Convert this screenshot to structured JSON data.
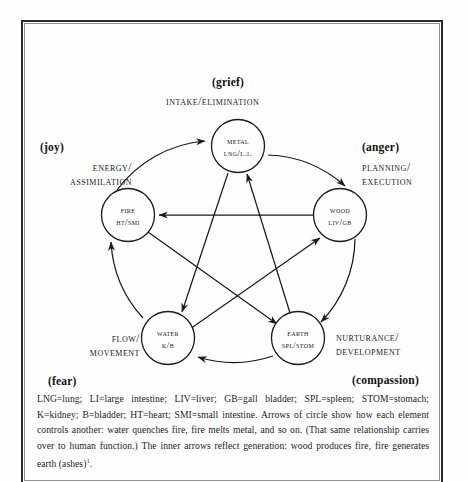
{
  "diagram": {
    "title_hidden": "Five Element (Wu Xing) cycle",
    "nodes": [
      {
        "id": "metal",
        "element": "METAL",
        "organs": "LNG/L.I.",
        "emotion": "(grief)",
        "function_line1": "Intake/",
        "function_line2": "Elimination"
      },
      {
        "id": "fire",
        "element": "FIRE",
        "organs": "HT/SMI",
        "emotion": "(joy)",
        "function_line1": "Energy/",
        "function_line2": "Assimilation"
      },
      {
        "id": "wood",
        "element": "WOOD",
        "organs": "LIV/GB",
        "emotion": "(anger)",
        "function_line1": "Planning/",
        "function_line2": "Execution"
      },
      {
        "id": "water",
        "element": "WATER",
        "organs": "K/B",
        "emotion": "(fear)",
        "function_line1": "Flow/",
        "function_line2": "Movement"
      },
      {
        "id": "earth",
        "element": "EARTH",
        "organs": "SPL/STOM",
        "emotion": "(compassion)",
        "function_line1": "Nurturance/",
        "function_line2": "Development"
      }
    ],
    "outer_cycle_name": "controlling cycle",
    "outer_arrows": [
      {
        "from": "fire",
        "to": "metal"
      },
      {
        "from": "metal",
        "to": "wood"
      },
      {
        "from": "wood",
        "to": "earth"
      },
      {
        "from": "earth",
        "to": "water"
      },
      {
        "from": "water",
        "to": "fire"
      }
    ],
    "inner_cycle_name": "generation cycle",
    "inner_arrows": [
      {
        "from": "wood",
        "to": "fire"
      },
      {
        "from": "fire",
        "to": "earth"
      },
      {
        "from": "earth",
        "to": "metal"
      },
      {
        "from": "metal",
        "to": "water"
      },
      {
        "from": "water",
        "to": "wood"
      }
    ]
  },
  "caption": {
    "text": "LNG=lung; LI=large intestine; LIV=liver; GB=gall bladder; SPL=spleen; STOM=stomach; K=kidney; B=bladder; HT=heart; SMI=small intestine. Arrows of circle show how each element controls another: water quenches fire, fire melts metal, and so on. (That same relationship carries over to human function.) The inner arrows reflect generation: wood produces fire, fire generates earth (ashes)",
    "footnote_marker": "1"
  },
  "colors": {
    "ink": "#1a1a1a",
    "paper": "#fefefe",
    "frame": "#2a2a2a"
  }
}
